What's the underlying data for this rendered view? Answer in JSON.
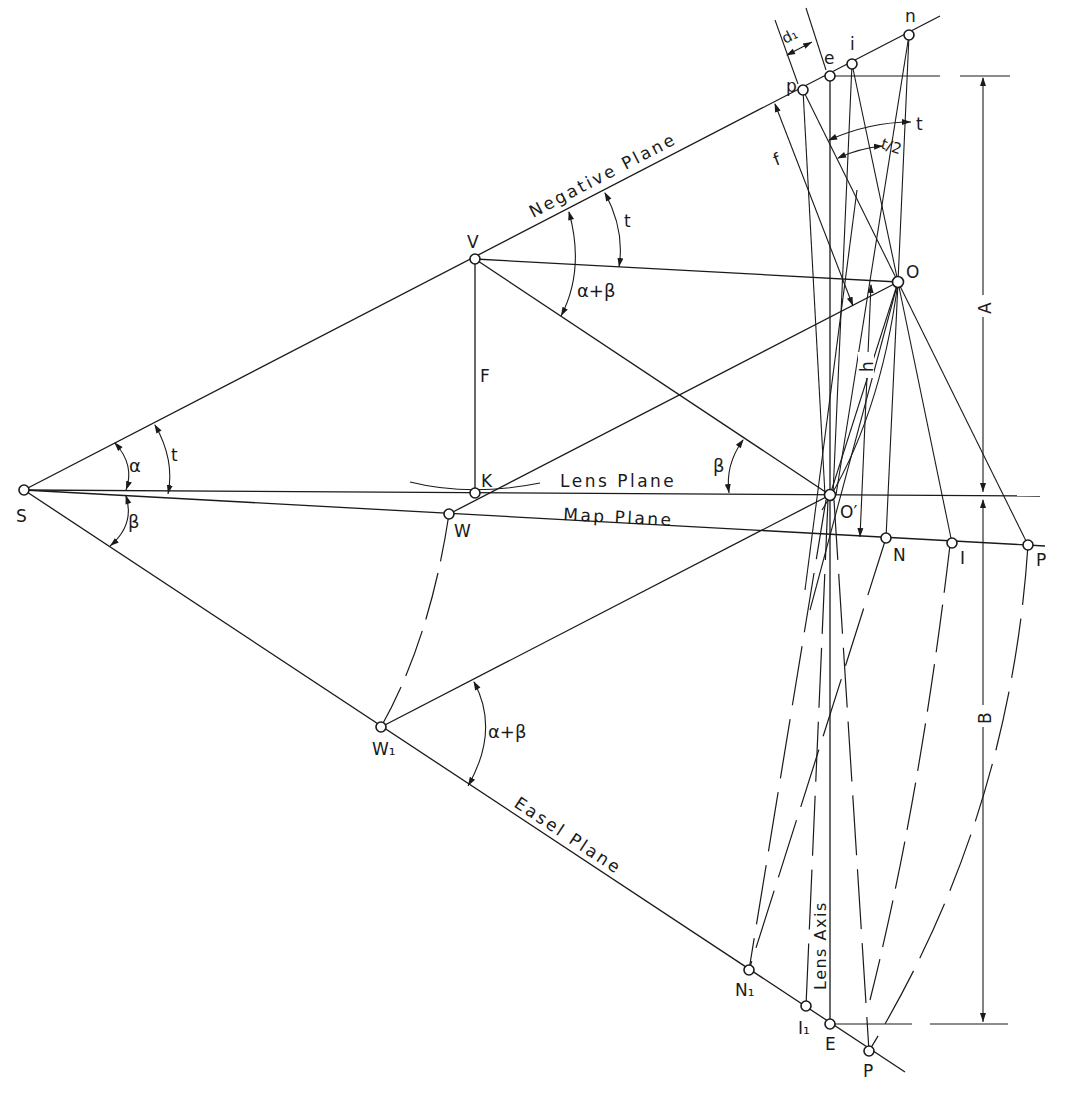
{
  "diagram": {
    "points": [
      {
        "id": "S",
        "label": "S",
        "x": 24,
        "y": 490
      },
      {
        "id": "V",
        "label": "V",
        "x": 475,
        "y": 259
      },
      {
        "id": "K",
        "label": "K",
        "x": 475,
        "y": 493
      },
      {
        "id": "W",
        "label": "W",
        "x": 449,
        "y": 514
      },
      {
        "id": "W1",
        "label": "W₁",
        "x": 381,
        "y": 727
      },
      {
        "id": "O_prime",
        "label": "O′",
        "x": 830,
        "y": 495
      },
      {
        "id": "O",
        "label": "O",
        "x": 898,
        "y": 282
      },
      {
        "id": "N",
        "label": "N",
        "x": 886,
        "y": 538
      },
      {
        "id": "I",
        "label": "I",
        "x": 952,
        "y": 543
      },
      {
        "id": "P",
        "label": "P",
        "x": 1028,
        "y": 545
      },
      {
        "id": "N1",
        "label": "N₁",
        "x": 749,
        "y": 970
      },
      {
        "id": "I1",
        "label": "I₁",
        "x": 806,
        "y": 1006
      },
      {
        "id": "E",
        "label": "E",
        "x": 830,
        "y": 1024
      },
      {
        "id": "P1",
        "label": "P",
        "x": 869,
        "y": 1051
      },
      {
        "id": "p",
        "label": "p",
        "x": 803,
        "y": 90
      },
      {
        "id": "e",
        "label": "e",
        "x": 830,
        "y": 76
      },
      {
        "id": "i",
        "label": "i",
        "x": 852,
        "y": 64
      },
      {
        "id": "n",
        "label": "n",
        "x": 909,
        "y": 35
      }
    ],
    "planes": {
      "negative": "Negative Plane",
      "lens": "Lens Plane",
      "map": "Map Plane",
      "easel": "Easel Plane",
      "lens_axis": "Lens Axis"
    },
    "segment_labels": {
      "F": "F",
      "f": "f",
      "h": "h",
      "A": "A",
      "B": "B",
      "d1": "d₁"
    },
    "angle_labels": {
      "alpha": "α",
      "beta_at_S": "β",
      "t_at_S": "t",
      "t_at_V": "t",
      "alpha_plus_beta_at_V": "α+β",
      "beta_at_O_prime": "β",
      "alpha_plus_beta_at_W1": "α+β",
      "t_top": "t",
      "t_half": "t/2"
    },
    "colors": {
      "ink": "#1a1a1a",
      "paper": "#ffffff"
    }
  }
}
